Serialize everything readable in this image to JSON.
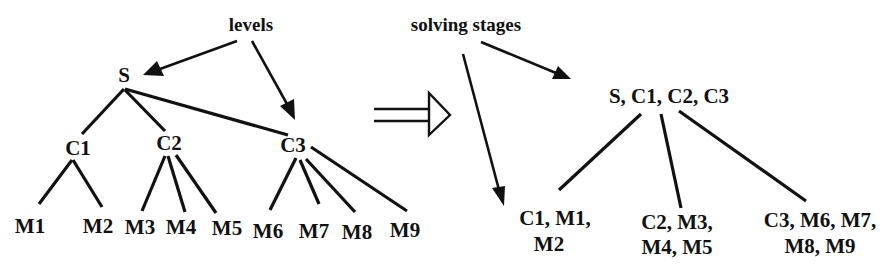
{
  "diagram": {
    "annotations": {
      "levels": "levels",
      "solving_stages": "solving stages"
    },
    "hierarchy_tree": {
      "root": "S",
      "children": [
        {
          "label": "C1",
          "children": [
            "M1",
            "M2"
          ]
        },
        {
          "label": "C2",
          "children": [
            "M3",
            "M4",
            "M5"
          ]
        },
        {
          "label": "C3",
          "children": [
            "M6",
            "M7",
            "M8",
            "M9"
          ]
        }
      ],
      "nodes": {
        "S": "S",
        "C1": "C1",
        "C2": "C2",
        "C3": "C3",
        "M1": "M1",
        "M2": "M2",
        "M3": "M3",
        "M4": "M4",
        "M5": "M5",
        "M6": "M6",
        "M7": "M7",
        "M8": "M8",
        "M9": "M9"
      }
    },
    "transform_arrow": "implies-arrow",
    "stage_tree": {
      "root": "S, C1, C2, C3",
      "stages": [
        {
          "line1": "C1, M1,",
          "line2": "M2"
        },
        {
          "line1": "C2, M3,",
          "line2": "M4, M5"
        },
        {
          "line1": "C3, M6, M7,",
          "line2": "M8, M9"
        }
      ]
    },
    "colors": {
      "ink": "#111111",
      "background": "#ffffff"
    }
  }
}
